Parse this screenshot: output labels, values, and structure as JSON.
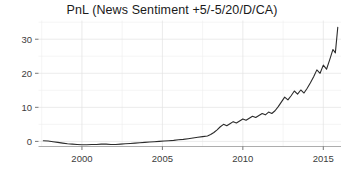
{
  "chart_data": {
    "type": "line",
    "title": "PnL (News Sentiment +5/-5/20/D/CA)",
    "subtitle": "",
    "xlabel": "",
    "ylabel": "",
    "xlim": [
      1997.3,
      2016.1
    ],
    "ylim": [
      -1.5,
      35.5
    ],
    "grid": true,
    "legend": null,
    "legend_position": "none",
    "x_ticks": [
      2000,
      2005,
      2010,
      2015
    ],
    "x_tick_labels": [
      "2000",
      "2005",
      "2010",
      "2015"
    ],
    "x_minor_ticks": [
      1997.5,
      2002.5,
      2007.5,
      2012.5
    ],
    "y_ticks": [
      0,
      10,
      20,
      30
    ],
    "y_tick_labels": [
      "0",
      "10",
      "20",
      "30"
    ],
    "y_minor_ticks": [
      5,
      15,
      25,
      35
    ],
    "line_color": "#2b2b2b",
    "background_color": "#ffffff",
    "grid_color": "#e2e2e2",
    "series": [
      {
        "name": "PnL",
        "x": [
          1997.6,
          1997.9,
          1998.2,
          1998.5,
          1998.8,
          1999.1,
          1999.4,
          1999.7,
          2000.0,
          2000.3,
          2000.6,
          2000.9,
          2001.2,
          2001.5,
          2001.8,
          2002.1,
          2002.4,
          2002.7,
          2003.0,
          2003.3,
          2003.6,
          2003.9,
          2004.2,
          2004.5,
          2004.8,
          2005.1,
          2005.4,
          2005.7,
          2006.0,
          2006.3,
          2006.6,
          2006.9,
          2007.2,
          2007.5,
          2007.8,
          2008.0,
          2008.2,
          2008.4,
          2008.6,
          2008.8,
          2009.0,
          2009.2,
          2009.4,
          2009.6,
          2009.8,
          2010.0,
          2010.2,
          2010.4,
          2010.6,
          2010.8,
          2011.0,
          2011.2,
          2011.4,
          2011.6,
          2011.8,
          2012.0,
          2012.2,
          2012.4,
          2012.6,
          2012.8,
          2013.0,
          2013.2,
          2013.4,
          2013.6,
          2013.8,
          2014.0,
          2014.2,
          2014.4,
          2014.6,
          2014.8,
          2015.0,
          2015.2,
          2015.4,
          2015.6,
          2015.75,
          2015.9
        ],
        "y": [
          0.2,
          0.1,
          -0.1,
          -0.3,
          -0.5,
          -0.7,
          -0.8,
          -0.9,
          -1.0,
          -1.0,
          -0.9,
          -0.9,
          -0.8,
          -0.8,
          -0.9,
          -0.9,
          -0.8,
          -0.7,
          -0.6,
          -0.5,
          -0.4,
          -0.3,
          -0.2,
          -0.1,
          0.0,
          0.1,
          0.2,
          0.3,
          0.5,
          0.6,
          0.8,
          1.0,
          1.2,
          1.4,
          1.6,
          2.0,
          2.6,
          3.4,
          4.3,
          5.0,
          4.6,
          5.2,
          5.8,
          5.4,
          6.0,
          6.6,
          6.2,
          6.8,
          7.4,
          7.0,
          7.6,
          8.2,
          7.8,
          8.6,
          8.2,
          9.0,
          10.2,
          11.6,
          13.0,
          12.2,
          13.4,
          14.8,
          13.9,
          15.1,
          14.2,
          15.6,
          17.2,
          19.0,
          21.0,
          20.0,
          22.4,
          21.2,
          24.0,
          27.0,
          26.0,
          33.5
        ]
      }
    ]
  }
}
